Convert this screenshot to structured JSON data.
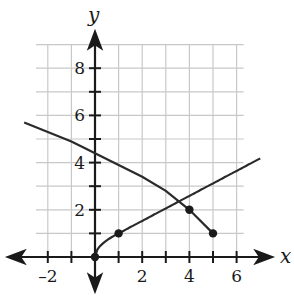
{
  "chart_data": {
    "type": "line",
    "title": "",
    "xlabel": "x",
    "ylabel": "y",
    "xlim": [
      -3,
      7
    ],
    "ylim": [
      -1,
      9
    ],
    "grid": true,
    "x_ticks": [
      -2,
      -1,
      0,
      1,
      2,
      3,
      4,
      5,
      6
    ],
    "x_tick_labels": [
      "-2",
      "2",
      "4",
      "6"
    ],
    "y_ticks": [
      1,
      2,
      3,
      4,
      5,
      6,
      7,
      8
    ],
    "y_tick_labels": [
      "2",
      "4",
      "6",
      "8"
    ],
    "series": [
      {
        "name": "increasing curve (y = 2*sqrt(x) shape)",
        "x": [
          0,
          1,
          2,
          3,
          4,
          5,
          6,
          7
        ],
        "y": [
          0,
          1,
          1.6,
          2.2,
          2.7,
          3.2,
          3.7,
          4.2
        ],
        "marked_points": [
          [
            0,
            0
          ],
          [
            1,
            1
          ]
        ]
      },
      {
        "name": "decreasing curve ending at (5, 1)",
        "x": [
          -3,
          -2,
          -1,
          0,
          1,
          2,
          3,
          4,
          5
        ],
        "y": [
          5.7,
          5.3,
          4.9,
          4.4,
          3.9,
          3.4,
          2.8,
          2.0,
          1.0
        ],
        "marked_points": [
          [
            4,
            2
          ],
          [
            5,
            1
          ]
        ]
      }
    ]
  }
}
